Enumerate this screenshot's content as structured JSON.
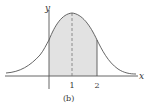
{
  "figure": {
    "caption": "(b)",
    "axes": {
      "x_label": "x",
      "y_label": "y"
    },
    "ticks": [
      {
        "value": 1,
        "label": "1"
      },
      {
        "value": 2,
        "label": "2"
      }
    ],
    "curve": {
      "type": "bell-curve",
      "peak_at": 1
    },
    "shaded_region": {
      "from": 0,
      "to": 2
    },
    "dashed_line_at": 1,
    "colors": {
      "shade": "#e2e2e2",
      "stroke": "#555555"
    }
  }
}
